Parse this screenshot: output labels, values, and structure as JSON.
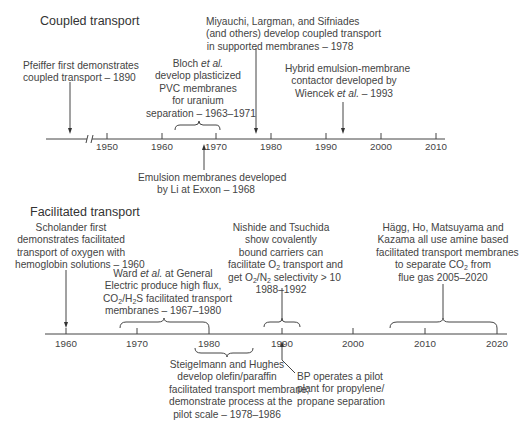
{
  "coupled": {
    "title": "Coupled transport",
    "axis_ticks": [
      "1950",
      "1960",
      "1970",
      "1980",
      "1990",
      "2000",
      "2010"
    ],
    "events": {
      "pfeiffer": [
        "Pfeiffer first demonstrates",
        "coupled transport – 1890"
      ],
      "bloch": [
        "Bloch ",
        "et al.",
        "develop plasticized",
        "PVC membranes",
        "for uranium",
        "separation – 1963–1971"
      ],
      "miyauchi": [
        "Miyauchi, Largman, and Sifniades",
        "(and others) develop coupled transport",
        "in supported membranes – 1978"
      ],
      "hybrid": [
        "Hybrid emulsion-membrane",
        "contactor developed by",
        "Wiencek ",
        "et al.",
        " – 1993"
      ],
      "li": [
        "Emulsion membranes developed",
        "by Li at Exxon – 1968"
      ]
    }
  },
  "facilitated": {
    "title": "Facilitated transport",
    "axis_ticks": [
      "1960",
      "1970",
      "1980",
      "1990",
      "2000",
      "2010",
      "2020"
    ],
    "events": {
      "scholander": [
        "Scholander first",
        "demonstrates facilitated",
        "transport of oxygen with",
        "hemoglobin solutions – 1960"
      ],
      "ward": [
        "Ward ",
        "et al.",
        " at General",
        "Electric produce high flux,",
        "CO",
        "2",
        "/H",
        "2",
        "S facilitated transport",
        "membranes – 1967–1980"
      ],
      "nishide": [
        "Nishide and Tsuchida",
        "show covalently",
        "bound carriers can",
        "facilitate O",
        "2",
        " transport and",
        "get O",
        "2",
        "/N",
        "2",
        " selectivity > 10",
        "1988–1992"
      ],
      "hagg": [
        "Hägg, Ho, Matsuyama and",
        "Kazama all use amine based",
        "facilitated transport membranes",
        "to separate CO",
        "2",
        " from",
        "flue gas 2005–2020"
      ],
      "steigelmann": [
        "Steigelmann and Hughes",
        "develop olefin/paraffin",
        "facilitated transport membrane;",
        "demonstrate process at the",
        "pilot scale – 1978–1986"
      ],
      "bp": [
        "BP operates a pilot",
        "plant for propylene/",
        "propane separation"
      ]
    }
  }
}
